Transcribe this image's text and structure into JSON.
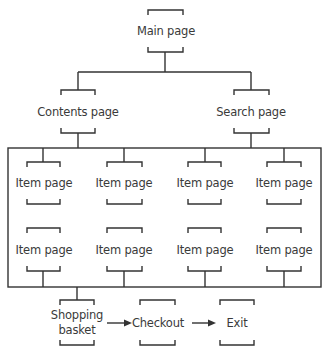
{
  "diagram": {
    "type": "site-structure",
    "nodes": {
      "main": {
        "label": "Main page"
      },
      "contents": {
        "label": "Contents page"
      },
      "search": {
        "label": "Search page"
      },
      "items": [
        {
          "label": "Item page"
        },
        {
          "label": "Item page"
        },
        {
          "label": "Item page"
        },
        {
          "label": "Item page"
        },
        {
          "label": "Item page"
        },
        {
          "label": "Item page"
        },
        {
          "label": "Item page"
        },
        {
          "label": "Item page"
        }
      ],
      "basket": {
        "label_line1": "Shopping",
        "label_line2": "basket"
      },
      "checkout": {
        "label": "Checkout"
      },
      "exit": {
        "label": "Exit"
      }
    },
    "edges": [
      [
        "Main page",
        "Contents page"
      ],
      [
        "Main page",
        "Search page"
      ],
      [
        "Contents page",
        "Item pages group"
      ],
      [
        "Search page",
        "Item pages group"
      ],
      [
        "Item pages group",
        "Shopping basket"
      ],
      [
        "Shopping basket",
        "Checkout"
      ],
      [
        "Checkout",
        "Exit"
      ]
    ],
    "line_color": "#333333"
  }
}
